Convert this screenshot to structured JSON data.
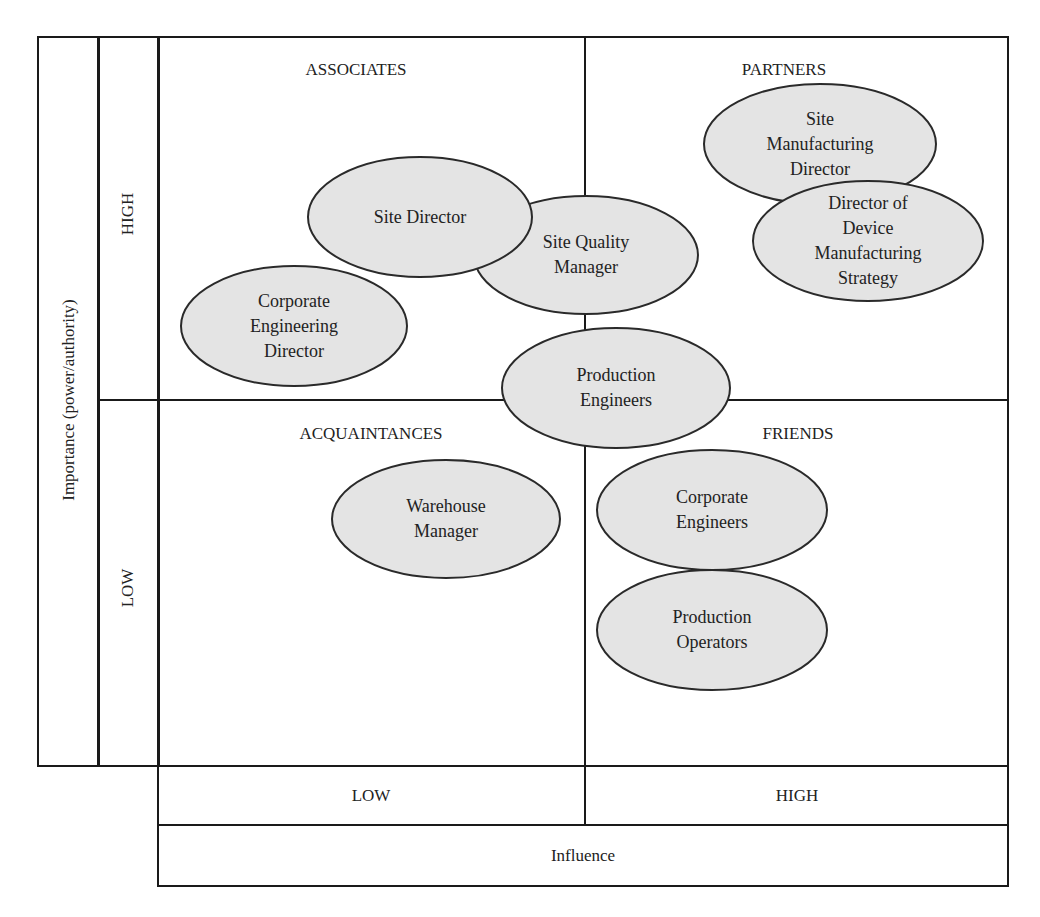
{
  "y_axis": {
    "title": "Importance (power/authority)",
    "levels": [
      "HIGH",
      "LOW"
    ]
  },
  "x_axis": {
    "title": "Influence",
    "levels": [
      "LOW",
      "HIGH"
    ]
  },
  "quadrants": {
    "top_left": "ASSOCIATES",
    "top_right": "PARTNERS",
    "bottom_left": "ACQUAINTANCES",
    "bottom_right": "FRIENDS"
  },
  "colors": {
    "ellipse_fill": "#e4e4e4",
    "ellipse_stroke": "#2a2a2a",
    "line": "#1a1a1a"
  },
  "stakeholders": [
    {
      "name": "Site Quality Manager",
      "lines": [
        "Site Quality",
        "Manager"
      ],
      "cx": 586,
      "cy": 255,
      "rx": 112,
      "ry": 59
    },
    {
      "name": "Site Director",
      "lines": [
        "Site Director"
      ],
      "cx": 420,
      "cy": 217,
      "rx": 112,
      "ry": 60
    },
    {
      "name": "Corporate Engineering Director",
      "lines": [
        "Corporate",
        "Engineering",
        "Director"
      ],
      "cx": 294,
      "cy": 326,
      "rx": 113,
      "ry": 60
    },
    {
      "name": "Production Engineers",
      "lines": [
        "Production",
        "Engineers"
      ],
      "cx": 616,
      "cy": 388,
      "rx": 114,
      "ry": 60
    },
    {
      "name": "Site Manufacturing Director",
      "lines": [
        "Site",
        "Manufacturing",
        "Director"
      ],
      "cx": 820,
      "cy": 144,
      "rx": 116,
      "ry": 60
    },
    {
      "name": "Director of Device Manufacturing Strategy",
      "lines": [
        "Director of",
        "Device",
        "Manufacturing",
        "Strategy"
      ],
      "cx": 868,
      "cy": 241,
      "rx": 115,
      "ry": 60
    },
    {
      "name": "Warehouse Manager",
      "lines": [
        "Warehouse",
        "Manager"
      ],
      "cx": 446,
      "cy": 519,
      "rx": 114,
      "ry": 59
    },
    {
      "name": "Corporate Engineers",
      "lines": [
        "Corporate",
        "Engineers"
      ],
      "cx": 712,
      "cy": 510,
      "rx": 115,
      "ry": 60
    },
    {
      "name": "Production Operators",
      "lines": [
        "Production",
        "Operators"
      ],
      "cx": 712,
      "cy": 630,
      "rx": 115,
      "ry": 60
    }
  ]
}
